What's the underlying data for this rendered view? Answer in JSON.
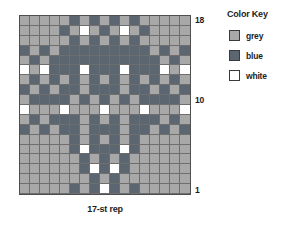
{
  "legend": {
    "title": "Color Key",
    "items": [
      {
        "name": "grey",
        "color": "#a8a8a8"
      },
      {
        "name": "blue",
        "color": "#5c6671"
      },
      {
        "name": "white",
        "color": "#ffffff"
      }
    ]
  },
  "chart": {
    "stitch_columns": 17,
    "row_count": 18,
    "row_labels": [
      {
        "row": 18,
        "text": "18"
      },
      {
        "row": 10,
        "text": "10"
      },
      {
        "row": 1,
        "text": "1"
      }
    ],
    "bottom_label": "17-st rep",
    "cell_codes": {
      "G": "grey",
      "B": "blue",
      "W": "white"
    },
    "grid_rows_top_to_bottom": [
      "GGGGGBGBGBGBGGGGG",
      "GGGGBGWGBGWGBGGGG",
      "GGGGGBGBGBGBGGGGG",
      "BGBGBBBBBBBBBGBGB",
      "GBGBBBBBBBBBBBGBG",
      "WGWBBBWBBBWBBBWGW",
      "GBGBGBGBGBGBGBGBG",
      "BGBGBBGBBBGBBGBGB",
      "GBBBBGBGBGBGBBBBG",
      "WGGGWGGGWGGGWGGGW",
      "GBGBBBGBGBGBBBGBG",
      "BGBGBBGBBBGBBGBGB",
      "GGGGGBGBGBGBGGGGG",
      "GGGGGBWBBBWBGGGGG",
      "GGGGGGBGBGBGGGGGG",
      "GGGGGGBWBWBGGGGGG",
      "GGGGGGGBGBGGGGGGG",
      "GGGGGBGBWBGBGGGGG"
    ]
  }
}
